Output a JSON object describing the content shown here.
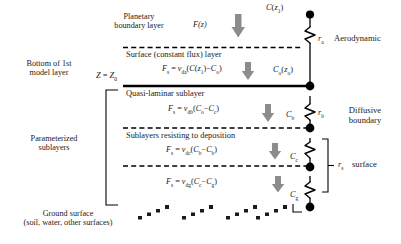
{
  "figure": {
    "type": "resistance-analogy-diagram"
  },
  "top": {
    "pbl_line1": "Planetary",
    "pbl_line2": "boundary layer",
    "flux_symbol": "F(z)",
    "top_concentration": "C(z₁)"
  },
  "left_labels": {
    "bottom_model_line1": "Bottom of 1st",
    "bottom_model_line2": "model layer",
    "height_marker": "Z = Z₀",
    "parameterized_line1": "Parameterized",
    "parameterized_line2": "sublayers",
    "ground_line1": "Ground surface",
    "ground_line2": "(soil, water, other surfaces)"
  },
  "layers": [
    {
      "name": "Surface (constant flux) layer",
      "formula": "Fₛ = v_da(C(z₁)−Cₒ)",
      "formula_parts": {
        "lhs": "F",
        "lhs_sub": "s",
        "v": "v",
        "v_sub": "da",
        "arg": "(C(z₁)−Cₒ)"
      },
      "concentration": "Cₒ(zₒ)"
    },
    {
      "name": "Quasi-laminar sublayer",
      "formula": "Fₛ = v_db(Cₒ−C_c)",
      "formula_parts": {
        "lhs": "F",
        "lhs_sub": "s",
        "v": "v",
        "v_sub": "db",
        "arg": "(Cₒ−Cc)"
      },
      "concentration": "C_b"
    },
    {
      "name": "Sublayers resisting to deposition",
      "formula": "Fₛ = v_dc(C_b−C_b)",
      "formula_parts": {
        "lhs": "F",
        "lhs_sub": "s",
        "v": "v",
        "v_sub": "dc",
        "arg": "(C_b−C_b)"
      },
      "concentration": "C_c"
    },
    {
      "name": "",
      "formula": "Fₛ = v_dg(C_c−C_g)",
      "formula_parts": {
        "lhs": "F",
        "lhs_sub": "s",
        "v": "v",
        "v_sub": "dg",
        "arg": "(C_c−C_g)"
      },
      "concentration": "C_g"
    }
  ],
  "resistances": [
    {
      "symbol": "r",
      "sub": "a",
      "name_line1": "Aerodynamic",
      "name_line2": ""
    },
    {
      "symbol": "r",
      "sub": "b",
      "name_line1": "Diffusive",
      "name_line2": "boundary"
    },
    {
      "symbol": "r",
      "sub": "s",
      "name_line1": "surface",
      "name_line2": ""
    }
  ],
  "colors": {
    "ink": "#1a1a1a",
    "arrow": "#808080",
    "line": "#000000",
    "background": "#ffffff"
  }
}
